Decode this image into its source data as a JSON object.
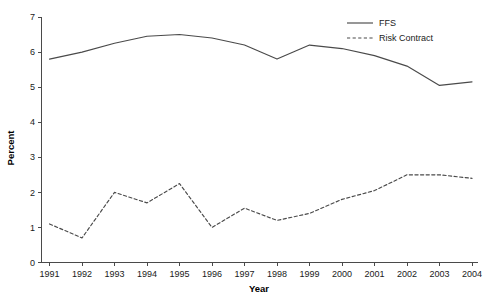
{
  "chart_data": {
    "type": "line",
    "title": "",
    "xlabel": "Year",
    "ylabel": "Percent",
    "x": [
      1991,
      1992,
      1993,
      1994,
      1995,
      1996,
      1997,
      1998,
      1999,
      2000,
      2001,
      2002,
      2003,
      2004
    ],
    "categories": [
      "1991",
      "1992",
      "1993",
      "1994",
      "1995",
      "1996",
      "1997",
      "1998",
      "1999",
      "2000",
      "2001",
      "2002",
      "2003",
      "2004"
    ],
    "xlim": [
      1991,
      2004
    ],
    "ylim": [
      0,
      7
    ],
    "yticks": [
      0,
      1,
      2,
      3,
      4,
      5,
      6,
      7
    ],
    "ytick_labels": [
      "0",
      "1",
      "2",
      "3",
      "4",
      "5",
      "6",
      "7"
    ],
    "grid": false,
    "legend_position": "top-right",
    "series": [
      {
        "name": "FFS",
        "style": "solid",
        "color": "#4a4a4a",
        "values": [
          5.8,
          6.0,
          6.25,
          6.45,
          6.5,
          6.4,
          6.2,
          5.8,
          6.2,
          6.1,
          5.9,
          5.6,
          5.05,
          5.15
        ]
      },
      {
        "name": "Risk Contract",
        "style": "dashed",
        "color": "#4a4a4a",
        "values": [
          1.1,
          0.7,
          2.0,
          1.7,
          2.25,
          1.0,
          1.55,
          1.2,
          1.4,
          1.8,
          2.05,
          2.5,
          2.5,
          2.4
        ]
      }
    ]
  },
  "legend": {
    "items": [
      {
        "label": "FFS"
      },
      {
        "label": "Risk Contract"
      }
    ]
  },
  "axes": {
    "y_title": "Percent",
    "x_title": "Year"
  },
  "footnote": {
    "text": ""
  }
}
